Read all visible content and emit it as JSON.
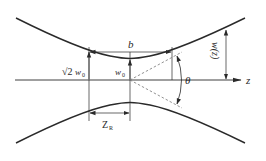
{
  "diagram": {
    "type": "gaussian-beam-propagation",
    "colors": {
      "line": "#2a2a2a",
      "dashed": "#777777",
      "background": "#ffffff"
    },
    "labels": {
      "axis_z": "z",
      "confocal_parameter": "b",
      "waist_radius": "w",
      "waist_radius_sub": "0",
      "sqrt2_waist": "√2",
      "sqrt2_waist_w": "w",
      "sqrt2_waist_sub": "0",
      "beam_radius": "w(z)",
      "divergence_angle": "θ",
      "rayleigh_range": "Z",
      "rayleigh_range_sub": "R"
    }
  }
}
